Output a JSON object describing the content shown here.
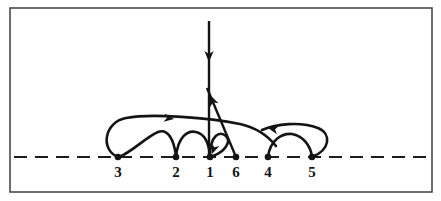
{
  "figure": {
    "background_color": "#ffffff",
    "ink_color": "#141414",
    "frame_color": "#4a4a4a",
    "frame": {
      "x": 10,
      "y": 8,
      "width": 422,
      "height": 184
    },
    "baseline": {
      "name": "dashed-axis",
      "y": 157,
      "x_start": 14,
      "x_end": 428,
      "dash": "13 8"
    }
  },
  "nodes": [
    {
      "id": "n3",
      "label": "3",
      "x": 118,
      "y": 157,
      "label_x": 118,
      "label_y": 177
    },
    {
      "id": "n2",
      "label": "2",
      "x": 176,
      "y": 157,
      "label_x": 176,
      "label_y": 177
    },
    {
      "id": "n1",
      "label": "1",
      "x": 210,
      "y": 157,
      "label_x": 210,
      "label_y": 177
    },
    {
      "id": "n6",
      "label": "6",
      "x": 236,
      "y": 157,
      "label_x": 236,
      "label_y": 177
    },
    {
      "id": "n4",
      "label": "4",
      "x": 268,
      "y": 157,
      "label_x": 268,
      "label_y": 177
    },
    {
      "id": "n5",
      "label": "5",
      "x": 312,
      "y": 157,
      "label_x": 312,
      "label_y": 177
    }
  ],
  "arcs": [
    {
      "id": "arc-3-to-right",
      "name": "arc-3-long-right",
      "from": "3",
      "to": "beyond-6",
      "direction": "right",
      "path": "M 118 157 C 100 150 104 122 126 118 C 152 113 210 118 240 124 C 258 128 268 136 276 146",
      "arrow": {
        "x": 174,
        "y": 119,
        "angle": 8
      }
    },
    {
      "id": "arc-3-2",
      "name": "arc-3-to-2",
      "from": "3",
      "to": "2",
      "direction": "right",
      "path": "M 119 157 C 132 152 146 137 158 132 C 168 128 174 140 176 156",
      "arrow": null
    },
    {
      "id": "arc-2-1",
      "name": "arc-2-to-1",
      "from": "2",
      "to": "1",
      "direction": "right",
      "path": "M 176 157 C 178 136 188 130 196 132 C 205 134 209 144 210 156",
      "arrow": null
    },
    {
      "id": "arc-1-loop",
      "name": "arc-1-self-loop",
      "from": "1",
      "to": "1",
      "direction": "right",
      "path": "M 210 157 C 210 134 220 131 226 136 C 232 142 224 152 213 156",
      "arrow": {
        "x": 212,
        "y": 154,
        "angle": 110
      }
    },
    {
      "id": "arc-5-left",
      "name": "arc-5-long-left",
      "from": "5",
      "to": "left-of-4",
      "direction": "left",
      "path": "M 312 157 C 330 150 332 134 318 128 C 300 121 276 124 262 130",
      "arrow": {
        "x": 268,
        "y": 128,
        "angle": 192
      }
    },
    {
      "id": "arc-4-5",
      "name": "arc-4-to-5",
      "from": "4",
      "to": "5",
      "direction": "right",
      "path": "M 268 157 C 270 140 282 133 292 134 C 303 136 310 145 312 156",
      "arrow": null
    }
  ],
  "straight_lines": [
    {
      "id": "vertical-entry",
      "name": "vertical-arrow-into-1",
      "orientation": "vertical",
      "path": "M 209 21 L 209 157",
      "arrow": {
        "x": 209,
        "y": 62,
        "angle": 90
      }
    },
    {
      "id": "diagonal-out",
      "name": "diagonal-arrow-from-6",
      "orientation": "diagonal",
      "path": "M 236 157 L 207 88",
      "arrow": {
        "x": 210,
        "y": 95,
        "angle": 247
      }
    }
  ],
  "legend": {
    "caption": "",
    "notes": ""
  }
}
